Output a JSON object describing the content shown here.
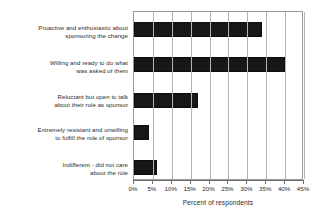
{
  "chart_data": {
    "type": "bar",
    "orientation": "horizontal",
    "title": "",
    "xlabel": "Percent of respondents",
    "ylabel": "",
    "xlim": [
      0,
      45
    ],
    "xtick_step": 5,
    "grid": true,
    "legend": null,
    "bar_color": "#171717",
    "categories": [
      "Proactive and enthusiastic about sponsoring the change",
      "Willing and ready to do what was asked of them",
      "Reluctant but open to talk about their role as sponsor",
      "Extremely resistant and unwilling to fulfill the role of sponsor",
      "Indifferent - did not care about the role"
    ],
    "category_lines": [
      [
        "Proactive and enthusiastic about",
        "sponsoring the change"
      ],
      [
        "Willing and ready to do what",
        "was asked of them"
      ],
      [
        "Reluctant but open to talk",
        "about their role as sponsor"
      ],
      [
        "Extremely resistant and unwilling",
        "to fulfill the role of sponsor"
      ],
      [
        "Indifferent - did not care",
        "about the role"
      ]
    ],
    "values": [
      34,
      40,
      17,
      4,
      6
    ],
    "tick_labels": [
      "0%",
      "5%",
      "10%",
      "15%",
      "20%",
      "25%",
      "30%",
      "35%",
      "40%",
      "45%"
    ],
    "tick_values": [
      0,
      5,
      10,
      15,
      20,
      25,
      30,
      35,
      40,
      45
    ]
  }
}
